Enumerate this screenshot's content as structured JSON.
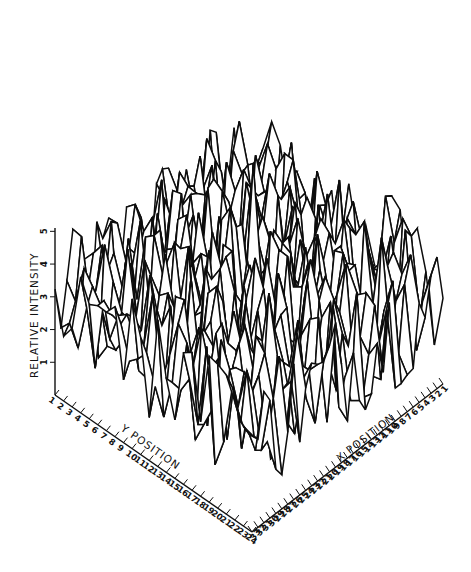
{
  "chart_data": {
    "type": "surface3d",
    "title": "",
    "style": "black wireframe with hidden-line removal, white faces",
    "xlabel": "X POSITION",
    "ylabel": "Y POSITION",
    "zlabel": "RELATIVE INTENSITY",
    "x_ticks": [
      "1",
      "2",
      "3",
      "4",
      "5",
      "6",
      "7",
      "8",
      "9",
      "10",
      "11",
      "12",
      "13",
      "14",
      "15",
      "16",
      "17",
      "18",
      "19",
      "20",
      "21",
      "22",
      "23",
      "24",
      "25",
      "26",
      "27",
      "28",
      "29",
      "30",
      "31",
      "32",
      "33"
    ],
    "y_ticks": [
      "1",
      "2",
      "3",
      "4",
      "5",
      "6",
      "7",
      "8",
      "9",
      "10",
      "11",
      "12",
      "13",
      "14",
      "15",
      "16",
      "17",
      "18",
      "19",
      "20",
      "21",
      "22",
      "23",
      "24"
    ],
    "z_ticks": [
      "1",
      "2",
      "3",
      "4",
      "5"
    ],
    "x_range": [
      1,
      33
    ],
    "y_range": [
      1,
      24
    ],
    "z_range": [
      0,
      5
    ],
    "x_direction": "decreasing left-to-right along front-right edge (33 at corner, 1 at far right)",
    "grid": false,
    "legend": null,
    "approx_peak": {
      "x": 17,
      "y": 12,
      "z": 5.0
    },
    "approx_mean_intensity": 2.5
  },
  "colors": {
    "line": "#0d0d0d",
    "face": "#ffffff",
    "background": "#ffffff"
  }
}
